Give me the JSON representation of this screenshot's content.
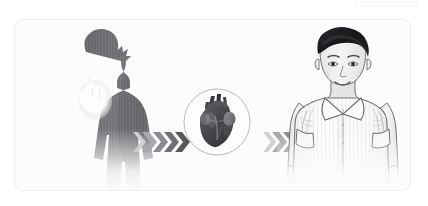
{
  "illustration": {
    "title": "Heart health transformation illustration",
    "description": "Three-stage medical illustration: a dark silhouette of a person with a glowing heart, an anatomical heart in a circle, and a smiling healthy man in a white shirt, connected by chevron arrows.",
    "background_color": "#ffffff",
    "card": {
      "background_color": "#fcfcfc",
      "border_color": "#eeeeee",
      "corner_radius": "9px"
    },
    "top_rule": {
      "name": "decorative-dashed-rule",
      "color": "#e9e9ec",
      "style": "dashed"
    },
    "stages": [
      {
        "id": "before",
        "name": "silhouette-figure",
        "label": "Shadowed person with glowing heart",
        "silhouette_color": "#6e6e72",
        "highlight_color": "#fdfdfd"
      },
      {
        "id": "organ",
        "name": "heart-badge",
        "label": "Anatomical heart in circular badge",
        "circle_stroke": "#b9b9bd",
        "heart_color": "#4a4a4e"
      },
      {
        "id": "after",
        "name": "healthy-figure",
        "label": "Smiling man in white collared shirt",
        "hair_color": "#1d1d20",
        "skin_color": "#efefef",
        "shirt_color": "#fbfbfb",
        "outline_color": "#646468"
      }
    ],
    "arrow_groups": [
      {
        "id": "arrow-group-1",
        "name": "progress-arrows-left",
        "count": 5,
        "direction": "right",
        "colors": [
          "#cfcfd3",
          "#a9a9ad",
          "#8b8b90",
          "#6f6f74",
          "#58585d"
        ]
      },
      {
        "id": "arrow-group-2",
        "name": "progress-arrows-right",
        "count": 5,
        "direction": "right",
        "colors": [
          "#cfcfd3",
          "#a9a9ad",
          "#8b8b90",
          "#6f6f74",
          "#58585d"
        ]
      }
    ]
  }
}
